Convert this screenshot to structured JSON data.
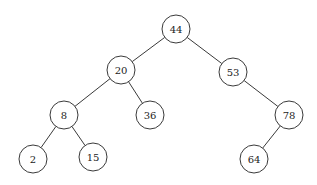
{
  "diagram": {
    "type": "binary-search-tree",
    "node_radius": 14,
    "stroke_color": "#3a3a3a",
    "nodes": [
      {
        "id": "n44",
        "label": "44",
        "x": 176,
        "y": 29
      },
      {
        "id": "n20",
        "label": "20",
        "x": 121,
        "y": 70
      },
      {
        "id": "n53",
        "label": "53",
        "x": 233,
        "y": 72
      },
      {
        "id": "n8",
        "label": "8",
        "x": 64,
        "y": 115
      },
      {
        "id": "n36",
        "label": "36",
        "x": 150,
        "y": 115
      },
      {
        "id": "n78",
        "label": "78",
        "x": 289,
        "y": 115
      },
      {
        "id": "n2",
        "label": "2",
        "x": 33,
        "y": 159
      },
      {
        "id": "n15",
        "label": "15",
        "x": 93,
        "y": 157
      },
      {
        "id": "n64",
        "label": "64",
        "x": 254,
        "y": 159
      }
    ],
    "edges": [
      {
        "from": "n44",
        "to": "n20"
      },
      {
        "from": "n44",
        "to": "n53"
      },
      {
        "from": "n20",
        "to": "n8"
      },
      {
        "from": "n20",
        "to": "n36"
      },
      {
        "from": "n53",
        "to": "n78"
      },
      {
        "from": "n8",
        "to": "n2"
      },
      {
        "from": "n8",
        "to": "n15"
      },
      {
        "from": "n78",
        "to": "n64"
      }
    ]
  }
}
